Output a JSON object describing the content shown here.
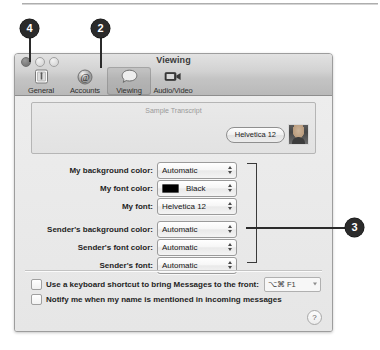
{
  "window": {
    "title": "Viewing",
    "traffic_lights": [
      "close",
      "minimize",
      "zoom"
    ]
  },
  "toolbar": {
    "items": [
      {
        "label": "General",
        "icon": "general-icon",
        "selected": false
      },
      {
        "label": "Accounts",
        "icon": "at-sign-icon",
        "selected": false
      },
      {
        "label": "Viewing",
        "icon": "speech-bubble-icon",
        "selected": true
      },
      {
        "label": "Audio/Video",
        "icon": "video-camera-icon",
        "selected": false
      }
    ]
  },
  "transcript": {
    "caption": "Sample Transcript",
    "bubble_text": "Helvetica 12",
    "avatar": "buddy-avatar"
  },
  "prefs": {
    "rows": [
      {
        "label": "My background color:",
        "value": "Automatic",
        "swatch": null
      },
      {
        "label": "My font color:",
        "value": "Black",
        "swatch": "#000000"
      },
      {
        "label": "My font:",
        "value": "Helvetica 12",
        "swatch": null
      },
      {
        "label": "Sender's background color:",
        "value": "Automatic",
        "swatch": null
      },
      {
        "label": "Sender's font color:",
        "value": "Automatic",
        "swatch": null
      },
      {
        "label": "Sender's font:",
        "value": "Automatic",
        "swatch": null
      }
    ]
  },
  "checkboxes": [
    {
      "label": "Use a keyboard shortcut to bring Messages to the front:",
      "checked": false,
      "has_field": true
    },
    {
      "label": "Notify me when my name is mentioned in incoming messages",
      "checked": false,
      "has_field": false
    }
  ],
  "shortcut_field": {
    "value": "⌥⌘ F1"
  },
  "help_button": {
    "label": "?"
  },
  "callouts": [
    {
      "number": "4",
      "target": "close-button"
    },
    {
      "number": "2",
      "target": "viewing-toolbar-item"
    },
    {
      "number": "3",
      "target": "font-color-group"
    }
  ]
}
